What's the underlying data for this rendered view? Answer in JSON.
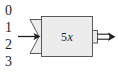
{
  "figure": {
    "kind": "function-machine-diagram",
    "background_color": "#ffffff",
    "stroke_color": "#58595b",
    "text_color": "#231f20",
    "box_fill_color": "#ececec",
    "input_column": {
      "label": "input values",
      "digits": [
        "0",
        "1",
        "2",
        "3"
      ]
    },
    "machine": {
      "rule_coefficient": "5",
      "rule_variable": "x",
      "rule_label": "5x"
    },
    "arrows": {
      "input_arrow": "input-arrow",
      "output_arrow": "output-double-arrow"
    }
  }
}
